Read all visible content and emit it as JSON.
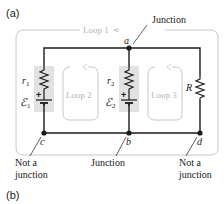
{
  "panels": {
    "a_label": "(a)",
    "b_label": "(b)"
  },
  "loops": {
    "loop1": "Loop 1",
    "loop2": "Loop 2",
    "loop3": "Loop 3"
  },
  "components": {
    "r1": "r",
    "r1_sub": "1",
    "r2": "r",
    "r2_sub": "2",
    "emf1": "ℰ",
    "emf1_sub": "1",
    "emf2": "ℰ",
    "emf2_sub": "2",
    "R": "R",
    "plus": "+"
  },
  "nodes": {
    "a": "a",
    "b": "b",
    "c": "c",
    "d": "d"
  },
  "annotations": {
    "junction_top": "Junction",
    "junction_bottom": "Junction",
    "not_junction_left_1": "Not a",
    "not_junction_left_2": "junction",
    "not_junction_right_1": "Not a",
    "not_junction_right_2": "junction"
  },
  "colors": {
    "wire": "#1a1a1a",
    "loop_outline": "#c8c8c8",
    "loop_text": "#b4b4b4",
    "battery_shade": "#e2e2e2"
  }
}
